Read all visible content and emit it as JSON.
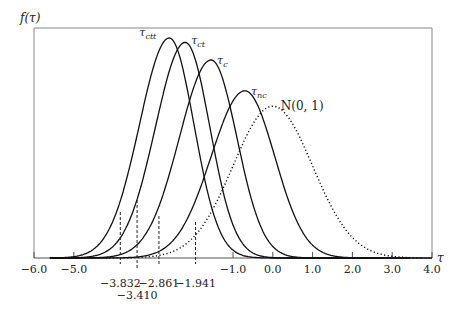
{
  "chart_data": {
    "type": "line",
    "title": "",
    "ylabel": "f(τ)",
    "xlabel": "τ",
    "xlim": [
      -6.0,
      4.0
    ],
    "x_ticks": [
      -6.0,
      -5.0,
      -1.0,
      0.0,
      1.0,
      2.0,
      3.0,
      4.0
    ],
    "x_tick_labels": [
      "−6.0",
      "−5.0",
      "−1.0",
      "0.0",
      "1.0",
      "2.0",
      "3.0",
      "4.0"
    ],
    "grid": false,
    "legend": "inline curve labels",
    "series": [
      {
        "name": "τctt",
        "label_main": "τ",
        "label_sub": "ctt",
        "peak_x": -2.6,
        "peak_height_rel": 1.0,
        "sd_left": 0.75,
        "sd_right": 0.62,
        "style": "solid"
      },
      {
        "name": "τct",
        "label_main": "τ",
        "label_sub": "ct",
        "peak_x": -2.2,
        "peak_height_rel": 0.98,
        "sd_left": 0.75,
        "sd_right": 0.62,
        "style": "solid"
      },
      {
        "name": "τc",
        "label_main": "τ",
        "label_sub": "c",
        "peak_x": -1.55,
        "peak_height_rel": 0.9,
        "sd_left": 0.8,
        "sd_right": 0.65,
        "style": "solid"
      },
      {
        "name": "τnc",
        "label_main": "τ",
        "label_sub": "nc",
        "peak_x": -0.7,
        "peak_height_rel": 0.76,
        "sd_left": 0.85,
        "sd_right": 0.75,
        "style": "solid"
      },
      {
        "name": "N(0,1)",
        "label_main": "N(0, 1)",
        "label_sub": "",
        "peak_x": 0.0,
        "peak_height_rel": 0.69,
        "sd_left": 1.0,
        "sd_right": 1.0,
        "style": "dotted"
      }
    ],
    "critical_values": [
      {
        "value": -3.832,
        "label": "−3.832",
        "row": 1
      },
      {
        "value": -3.41,
        "label": "−3.410",
        "row": 2
      },
      {
        "value": -2.861,
        "label": "−2.861",
        "row": 1
      },
      {
        "value": -1.941,
        "label": "−1.941",
        "row": 1
      }
    ]
  },
  "labels": {
    "ylabel": "f(τ)",
    "xlabel": "τ",
    "normal": "N(0, 1)"
  }
}
